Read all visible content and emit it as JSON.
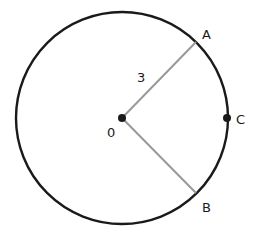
{
  "diagram": {
    "type": "circle-geometry",
    "center": {
      "label": "0",
      "x": 122,
      "y": 118
    },
    "radius_px": 106,
    "points": [
      {
        "label": "A",
        "x": 196,
        "y": 42
      },
      {
        "label": "B",
        "x": 196,
        "y": 193
      },
      {
        "label": "C",
        "x": 227,
        "y": 118
      }
    ],
    "segments": [
      {
        "from": "0",
        "to": "A",
        "length_label": "3"
      },
      {
        "from": "0",
        "to": "B"
      }
    ],
    "colors": {
      "circle": "#1a1a1a",
      "radius_lines": "#999999",
      "points": "#1a1a1a"
    }
  }
}
